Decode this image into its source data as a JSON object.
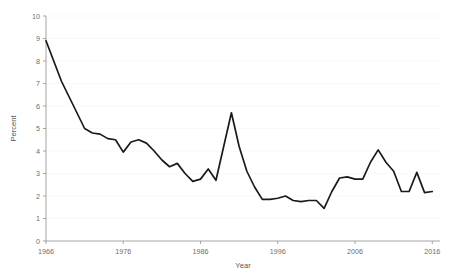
{
  "chart_data": {
    "type": "line",
    "title": "",
    "xlabel": "Year",
    "ylabel": "Percent",
    "xlim": [
      1966,
      2017
    ],
    "ylim": [
      0,
      10
    ],
    "xticks": [
      1966,
      1976,
      1986,
      1996,
      2006,
      2016
    ],
    "yticks": [
      0,
      1,
      2,
      3,
      4,
      5,
      6,
      7,
      8,
      9,
      10
    ],
    "grid": true,
    "legend": "none",
    "series": [
      {
        "name": "Percent",
        "color": "#1a1a1a",
        "x": [
          1966,
          1967,
          1968,
          1969,
          1970,
          1971,
          1972,
          1973,
          1974,
          1975,
          1976,
          1977,
          1978,
          1979,
          1980,
          1981,
          1982,
          1983,
          1984,
          1985,
          1986,
          1987,
          1988,
          1989,
          1990,
          1991,
          1992,
          1993,
          1994,
          1995,
          1996,
          1997,
          1998,
          1999,
          2000,
          2001,
          2002,
          2003,
          2004,
          2005,
          2006,
          2007,
          2008,
          2009,
          2010,
          2011,
          2012,
          2013,
          2014,
          2015,
          2016
        ],
        "values": [
          8.9,
          8.0,
          7.1,
          6.4,
          5.7,
          5.0,
          4.8,
          4.7,
          4.55,
          4.5,
          3.95,
          4.4,
          4.5,
          4.35,
          4.0,
          3.6,
          3.3,
          3.45,
          3.0,
          2.65,
          2.75,
          3.2,
          2.7,
          4.2,
          5.7,
          4.2,
          3.1,
          2.4,
          1.85,
          1.85,
          1.9,
          1.85,
          2.0,
          1.8,
          1.75,
          1.8,
          1.8,
          1.45,
          2.2,
          2.8,
          2.85,
          2.75,
          2.75,
          3.5,
          4.05,
          3.5,
          3.1,
          2.2,
          2.2,
          3.05,
          2.15
        ],
        "note_values_2011_2016": [
          2.2,
          2.15,
          2.1,
          2.05,
          2.1,
          2.2
        ]
      }
    ],
    "series_full": {
      "x": [
        1966,
        1967,
        1968,
        1969,
        1970,
        1971,
        1972,
        1973,
        1974,
        1975,
        1976,
        1977,
        1978,
        1979,
        1980,
        1981,
        1982,
        1983,
        1984,
        1985,
        1986,
        1987,
        1988,
        1989,
        1990,
        1991,
        1992,
        1993,
        1994,
        1995,
        1996,
        1997,
        1998,
        1999,
        2000,
        2001,
        2002,
        2003,
        2004,
        2005,
        2006,
        2007,
        2008,
        2009,
        2010,
        2011,
        2012,
        2013,
        2014,
        2015,
        2016
      ],
      "y": [
        8.9,
        8.0,
        7.1,
        6.4,
        5.7,
        5.0,
        4.8,
        4.75,
        4.55,
        4.5,
        3.95,
        4.4,
        4.5,
        4.35,
        4.0,
        3.6,
        3.3,
        3.45,
        3.0,
        2.65,
        2.75,
        3.2,
        2.7,
        4.2,
        5.7,
        4.2,
        3.1,
        2.4,
        1.85,
        1.85,
        1.9,
        2.0,
        1.8,
        1.75,
        1.8,
        1.8,
        1.45,
        2.2,
        2.8,
        2.85,
        2.75,
        2.75,
        3.5,
        4.05,
        3.5,
        3.1,
        2.2,
        2.2,
        3.05,
        2.15,
        2.2
      ]
    }
  },
  "axes": {
    "y_title": "Percent",
    "x_title": "Year",
    "y_tick_labels": [
      "10",
      "9",
      "8",
      "7",
      "6",
      "5",
      "4",
      "3",
      "2",
      "1",
      "0"
    ],
    "x_tick_labels": [
      "1966",
      "1976",
      "1986",
      "1996",
      "2006",
      "2016"
    ]
  },
  "colors": {
    "line": "#1a1a1a",
    "axis": "#9a9a9a",
    "grid": "#f7f7f7",
    "text": "#6e6e6e",
    "background": "#ffffff"
  }
}
